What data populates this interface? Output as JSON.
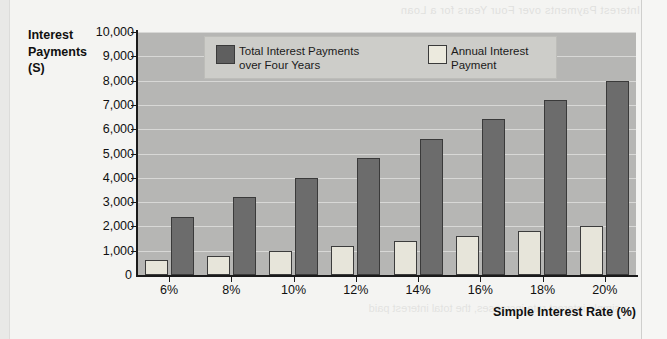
{
  "page": {
    "bleed_top_text": "Interest Payments over Four Years for a Loan",
    "bleed_bottom_text": "simple interest rate increases, the total interest paid"
  },
  "chart_data": {
    "type": "bar",
    "title": "",
    "xlabel": "Simple Interest Rate (%)",
    "ylabel": "Interest Payments (S)",
    "ylabel_lines": [
      "Interest",
      "Payments",
      "(S)"
    ],
    "categories": [
      "6%",
      "8%",
      "10%",
      "12%",
      "14%",
      "16%",
      "18%",
      "20%"
    ],
    "series": [
      {
        "name": "Annual Interest Payment",
        "legend_label": "Annual Interest\nPayment",
        "color": "#e7e5da",
        "values": [
          600,
          800,
          1000,
          1200,
          1400,
          1600,
          1800,
          2000
        ]
      },
      {
        "name": "Total Interest Payments over Four Years",
        "legend_label": "Total Interest Payments\nover Four Years",
        "color": "#6c6c6c",
        "values": [
          2400,
          3200,
          4000,
          4800,
          5600,
          6400,
          7200,
          8000
        ]
      }
    ],
    "ylim": [
      0,
      10000
    ],
    "ytick_values": [
      0,
      1000,
      2000,
      3000,
      4000,
      5000,
      6000,
      7000,
      8000,
      9000,
      10000
    ],
    "ytick_labels": [
      "0",
      "1,000",
      "2,000",
      "3,000",
      "4,000",
      "5,000",
      "6,000",
      "7,000",
      "8,000",
      "9,000",
      "10,000"
    ],
    "grid": true,
    "legend_position": "top-center",
    "plot_background": "#b6b6b4",
    "gridline_color": "#d8d8d6"
  }
}
